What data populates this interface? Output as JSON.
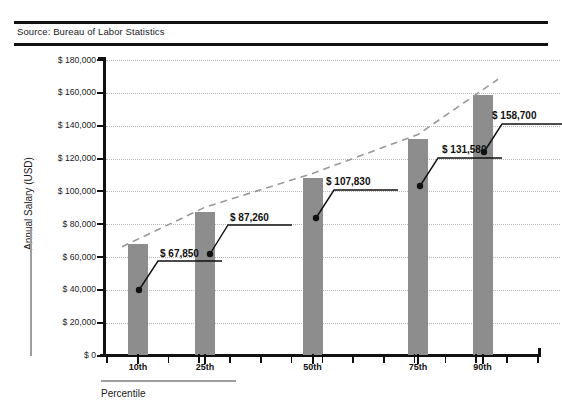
{
  "source": {
    "label": "Source: Bureau of Labor Statistics"
  },
  "chart_data": {
    "type": "bar",
    "title": "",
    "subtitle": "",
    "source_note": "Source: Bureau of Labor Statistics",
    "xlabel": "Percentile",
    "ylabel": "Annual Salary (USD)",
    "categories": [
      "10th",
      "25th",
      "50th",
      "75th",
      "90th"
    ],
    "values": [
      67850,
      87260,
      107830,
      131580,
      158700
    ],
    "value_labels": [
      "$ 67,850",
      "$ 87,260",
      "$ 107,830",
      "$ 131,580",
      "$ 158,700"
    ],
    "ylim": [
      0,
      180000
    ],
    "ytick_values": [
      0,
      20000,
      40000,
      60000,
      80000,
      100000,
      120000,
      140000,
      160000,
      180000
    ],
    "ytick_labels": [
      "$ 0",
      "$ 20,000",
      "$ 40,000",
      "$ 60,000",
      "$ 80,000",
      "$ 100,000",
      "$ 120,000",
      "$ 140,000",
      "$ 160,000",
      "$ 180,000"
    ],
    "grid": true,
    "grid_style": "dotted",
    "legend": "none",
    "series": [
      {
        "name": "Annual Salary (USD)",
        "type": "bar",
        "color": "#8d8d8d",
        "values": [
          67850,
          87260,
          107830,
          131580,
          158700
        ]
      },
      {
        "name": "Trend",
        "type": "line",
        "style": "dashed",
        "color": "#9a9a9a",
        "values": [
          67850,
          87260,
          107830,
          131580,
          158700
        ]
      }
    ],
    "annotations": [
      {
        "text": "$ 67,850",
        "category": "10th",
        "value": 67850
      },
      {
        "text": "$ 87,260",
        "category": "25th",
        "value": 87260
      },
      {
        "text": "$ 107,830",
        "category": "50th",
        "value": 107830
      },
      {
        "text": "$ 131,580",
        "category": "75th",
        "value": 131580
      },
      {
        "text": "$ 158,700",
        "category": "90th",
        "value": 158700
      }
    ]
  },
  "colors": {
    "bar": "#8d8d8d",
    "trend": "#9a9a9a",
    "grid": "#b9b9b9",
    "axis": "#111111",
    "text": "#1b1b1b"
  }
}
